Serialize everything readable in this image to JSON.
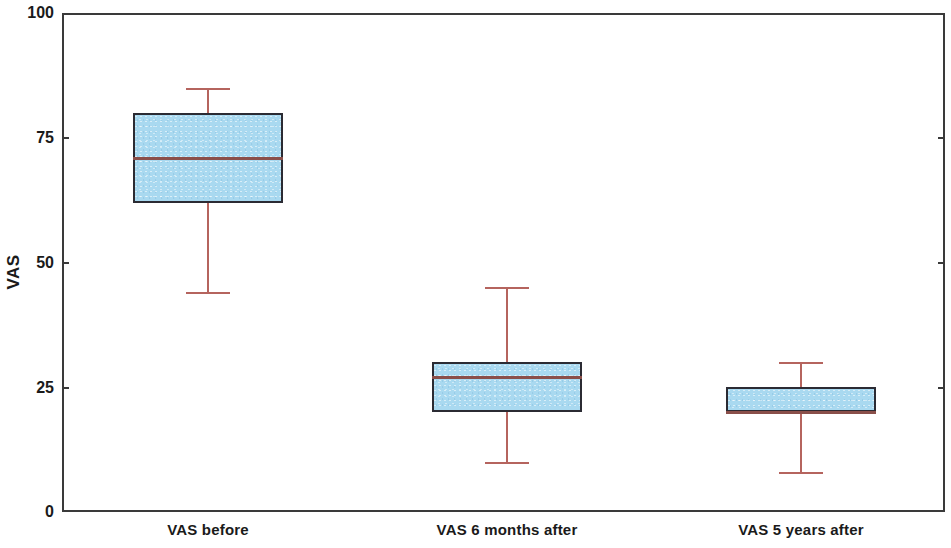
{
  "chart_data": {
    "type": "box",
    "title": "",
    "xlabel": "",
    "ylabel": "VAS",
    "ylim": [
      0,
      100
    ],
    "yticks": [
      0,
      25,
      50,
      75,
      100
    ],
    "ytick_labels": [
      "0",
      "25",
      "50",
      "75",
      "100"
    ],
    "grid": false,
    "legend": null,
    "categories": [
      "VAS before",
      "VAS 6 months after",
      "VAS 5 years after"
    ],
    "boxes": [
      {
        "category": "VAS before",
        "whisker_low": 44,
        "q1": 62,
        "median": 71,
        "q3": 80,
        "whisker_high": 85
      },
      {
        "category": "VAS 6 months after",
        "whisker_low": 10,
        "q1": 20,
        "median": 27,
        "q3": 30,
        "whisker_high": 45
      },
      {
        "category": "VAS 5 years after",
        "whisker_low": 8,
        "q1": 20,
        "median": 20,
        "q3": 25,
        "whisker_high": 30
      }
    ],
    "colors": {
      "box_fill": "#a9d9f0",
      "box_border": "#2b2b33",
      "median": "#8a4f4a",
      "whisker": "#b5645e",
      "axis": "#3a3a3a",
      "text": "#1a1a1a",
      "background": "#ffffff"
    }
  },
  "axis": {
    "y_title": "VAS",
    "tick_0": "0",
    "tick_25": "25",
    "tick_50": "50",
    "tick_75": "75",
    "tick_100": "100"
  },
  "x_labels": {
    "label_1": "VAS before",
    "label_2": "VAS 6 months after",
    "label_3": "VAS 5 years after"
  }
}
